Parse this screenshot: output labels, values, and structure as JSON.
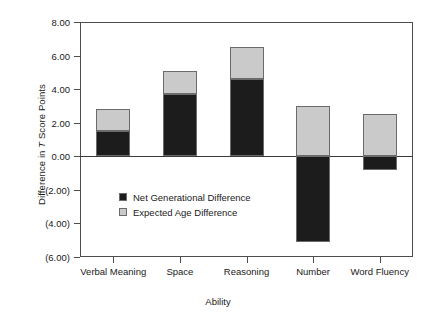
{
  "chart_data": {
    "type": "bar",
    "stacked": true,
    "title": "",
    "xlabel": "Ability",
    "ylabel": "Difference in T Score Points",
    "ylabel_italic_token": "T",
    "categories": [
      "Verbal Meaning",
      "Space",
      "Reasoning",
      "Number",
      "Word Fluency"
    ],
    "series": [
      {
        "name": "Net Generational Difference",
        "color": "#1c1c1c",
        "values": [
          1.5,
          3.7,
          4.6,
          -5.1,
          -0.8
        ]
      },
      {
        "name": "Expected Age Difference",
        "color": "#cacaca",
        "values": [
          1.3,
          1.4,
          1.9,
          3.0,
          2.5
        ]
      }
    ],
    "totals_positive": [
      2.8,
      5.1,
      6.5,
      3.0,
      2.5
    ],
    "ylim": [
      -6.0,
      8.0
    ],
    "ytick_values": [
      8.0,
      6.0,
      4.0,
      2.0,
      0.0,
      -2.0,
      -4.0,
      -6.0
    ],
    "ytick_labels": [
      "8.00",
      "6.00",
      "4.00",
      "2.00",
      "0.00",
      "(2.00)",
      "(4.00)",
      "(6.00)"
    ],
    "grid": false,
    "legend_position": "inside-lower-left",
    "zero_line": true
  },
  "legend": {
    "items": [
      {
        "label": "Net Generational Difference",
        "swatch": "dark"
      },
      {
        "label": "Expected Age Difference",
        "swatch": "light"
      }
    ]
  }
}
